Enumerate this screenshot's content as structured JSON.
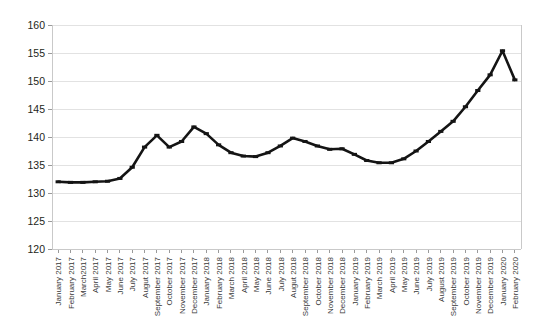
{
  "chart_data": {
    "type": "line",
    "title": "",
    "subtitle": "",
    "xlabel": "",
    "ylabel": "",
    "ylim": [
      120,
      160
    ],
    "ytick_labels": [
      "120",
      "125",
      "130",
      "135",
      "140",
      "145",
      "150",
      "155",
      "160"
    ],
    "ytick_values": [
      120,
      125,
      130,
      135,
      140,
      145,
      150,
      155,
      160
    ],
    "grid": true,
    "legend": "none",
    "categories": [
      "January 2017",
      "February 2017",
      "March2017",
      "April 2017",
      "May 2017",
      "June 2017",
      "July 2017",
      "Augut 2017",
      "September 2017",
      "October 2017",
      "November 2017",
      "December 2017",
      "January 2018",
      "February 2018",
      "March 2018",
      "April 2018",
      "May 2018",
      "June 2018",
      "July 2018",
      "Augut 2018",
      "September 2018",
      "October 2018",
      "November 2018",
      "December 2018",
      "January 2019",
      "February 2019",
      "March 2019",
      "April 2019",
      "May 2019",
      "June 2019",
      "July 2019",
      "August 2019",
      "September 2019",
      "October 2019",
      "November 2019",
      "December 2019",
      "January 2020",
      "February 2020"
    ],
    "values": [
      132.0,
      131.9,
      131.9,
      132.0,
      132.1,
      132.6,
      134.6,
      138.2,
      140.3,
      138.2,
      139.2,
      141.8,
      140.6,
      138.6,
      137.2,
      136.6,
      136.5,
      137.2,
      138.4,
      139.8,
      139.2,
      138.4,
      137.8,
      137.9,
      136.9,
      135.8,
      135.4,
      135.4,
      136.1,
      137.5,
      139.2,
      141.0,
      142.8,
      145.4,
      148.3,
      151.1,
      155.4,
      150.2
    ]
  }
}
